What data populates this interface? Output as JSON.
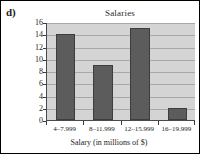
{
  "figure": {
    "part_label": "d)"
  },
  "chart_data": {
    "type": "bar",
    "title": "Salaries",
    "xlabel": "Salary (in millions of $)",
    "ylabel": "",
    "categories": [
      "4–7.999",
      "8–11.999",
      "12–15.999",
      "16–19.999"
    ],
    "values": [
      14,
      9,
      15,
      2
    ],
    "ylim": [
      0,
      16
    ],
    "ytick_labels": [
      "0",
      "2",
      "4",
      "6",
      "8",
      "10",
      "12",
      "14",
      "16"
    ],
    "ytick_values": [
      0,
      2,
      4,
      6,
      8,
      10,
      12,
      14,
      16
    ],
    "grid": true,
    "legend": null,
    "colors": {
      "bar_fill": "#5c5c5c",
      "bar_edge": "#3d3d3d",
      "plot_background": "#d4d4d4",
      "gridline": "#a8a8a8",
      "axis": "#4a4a4a",
      "text": "#232323"
    }
  }
}
